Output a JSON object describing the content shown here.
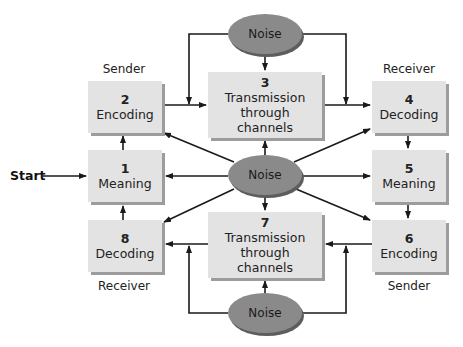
{
  "diagram": {
    "start_label": "Start",
    "roles": {
      "sender_top": "Sender",
      "receiver_top": "Receiver",
      "receiver_bottom": "Receiver",
      "sender_bottom": "Sender"
    },
    "steps": [
      {
        "num": "1",
        "label": "Meaning"
      },
      {
        "num": "2",
        "label": "Encoding"
      },
      {
        "num": "3",
        "label": "Transmission through channels"
      },
      {
        "num": "4",
        "label": "Decoding"
      },
      {
        "num": "5",
        "label": "Meaning"
      },
      {
        "num": "6",
        "label": "Encoding"
      },
      {
        "num": "7",
        "label": "Transmission through channels"
      },
      {
        "num": "8",
        "label": "Decoding"
      }
    ],
    "noise": {
      "top": "Noise",
      "center": "Noise",
      "bottom": "Noise"
    },
    "colors": {
      "box_fill": "#e3e3e3",
      "box_shadow": "#9c9c9c",
      "noise_fill": "#8a8a8a",
      "arrow": "#1a1a1a"
    }
  }
}
